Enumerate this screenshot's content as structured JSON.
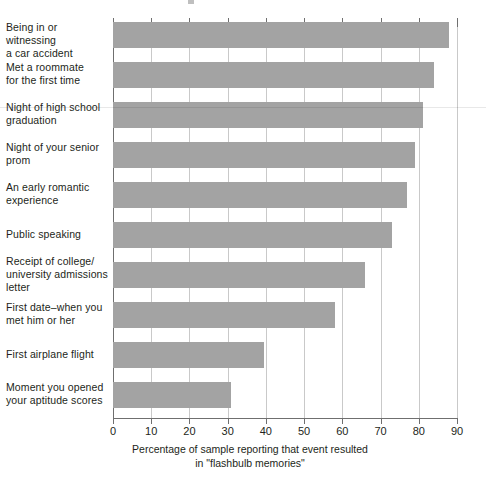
{
  "chart_data": {
    "type": "bar",
    "orientation": "horizontal",
    "title": "",
    "subtitle": "",
    "xlabel": "Percentage of sample reporting that event resulted in \"flashbulb memories\"",
    "xlabel_lines": [
      "Percentage of sample reporting that event resulted",
      "in \"flashbulb memories\""
    ],
    "ylabel": "",
    "xlim": [
      0,
      90
    ],
    "xticks": [
      0,
      10,
      20,
      30,
      40,
      50,
      60,
      70,
      80,
      90
    ],
    "xtick_labels": [
      "0",
      "10",
      "20",
      "30",
      "40",
      "50",
      "60",
      "70",
      "80",
      "90"
    ],
    "grid": "vertical",
    "legend": "none",
    "bar_color": "#a3a3a3",
    "axis_color": "#6f6f6f",
    "gridline_color": "#c9c9c9",
    "categories": [
      "Being in or witnessing a car accident",
      "Met a roommate for the first time",
      "Night of high school graduation",
      "Night of your senior prom",
      "An early romantic experience",
      "Public speaking",
      "Receipt of college/ university admissions letter",
      "First date–when you met him or her",
      "First airplane flight",
      "Moment you opened your aptitude scores"
    ],
    "category_label_lines": [
      [
        "Being in or witnessing",
        "a car accident"
      ],
      [
        "Met a roommate",
        "for the first time"
      ],
      [
        "Night of high school",
        "graduation"
      ],
      [
        "Night of your senior",
        "prom"
      ],
      [
        "An early romantic",
        "experience"
      ],
      [
        "Public speaking"
      ],
      [
        "Receipt of college/",
        "university admissions",
        "letter"
      ],
      [
        "First date–when you",
        "met him or her"
      ],
      [
        "First airplane flight"
      ],
      [
        "Moment you opened",
        "your aptitude scores"
      ]
    ],
    "values": [
      88,
      84,
      81,
      79,
      77,
      73,
      66,
      58,
      39.5,
      31
    ]
  }
}
